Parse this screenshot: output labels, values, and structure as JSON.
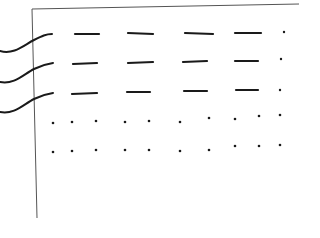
{
  "sketch": {
    "description": "Hand-drawn sketch: a framed page with three curved lines entering from the left, a grid of short dashes in three rows, and two rows of dots below",
    "stroke_color": "#1a1a1a",
    "frame_color": "#555555",
    "rows": [
      {
        "kind": "dashes",
        "count": 4,
        "trailing_dot": true
      },
      {
        "kind": "dashes",
        "count": 4,
        "trailing_dot": true
      },
      {
        "kind": "dashes",
        "count": 4,
        "trailing_dot": true
      },
      {
        "kind": "dots",
        "count": 10
      },
      {
        "kind": "dots",
        "count": 10
      }
    ],
    "curves": 3
  }
}
